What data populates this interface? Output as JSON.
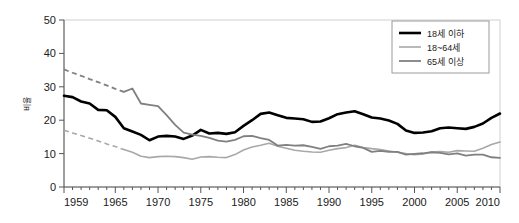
{
  "chart_data": {
    "type": "line",
    "title": "",
    "subtitle": "",
    "xlabel": "",
    "ylabel": "비율",
    "xlim": [
      1959,
      2010
    ],
    "ylim": [
      0,
      50
    ],
    "grid": false,
    "legend_position": "top-right",
    "x_tick_labels": [
      "1959",
      "1965",
      "1970",
      "1975",
      "1980",
      "1985",
      "1990",
      "1995",
      "2000",
      "2005",
      "2010"
    ],
    "x_tick_values": [
      1959,
      1965,
      1970,
      1975,
      1980,
      1985,
      1990,
      1995,
      2000,
      2005,
      2010
    ],
    "x_minor_tick_step": 1,
    "y_tick_labels": [
      "0",
      "10",
      "20",
      "30",
      "40",
      "50"
    ],
    "y_tick_values": [
      0,
      10,
      20,
      30,
      40,
      50
    ],
    "x": [
      1959,
      1960,
      1961,
      1962,
      1963,
      1964,
      1965,
      1966,
      1967,
      1968,
      1969,
      1970,
      1971,
      1972,
      1973,
      1974,
      1975,
      1976,
      1977,
      1978,
      1979,
      1980,
      1981,
      1982,
      1983,
      1984,
      1985,
      1986,
      1987,
      1988,
      1989,
      1990,
      1991,
      1992,
      1993,
      1994,
      1995,
      1996,
      1997,
      1998,
      1999,
      2000,
      2001,
      2002,
      2003,
      2004,
      2005,
      2006,
      2007,
      2008,
      2009,
      2010
    ],
    "series": [
      {
        "name": "18세 이하",
        "color": "#000000",
        "width": 2.6,
        "style": "solid",
        "dashed_until": 1959,
        "values": [
          27.3,
          26.9,
          25.6,
          25.0,
          23.1,
          23.0,
          21.0,
          17.6,
          16.6,
          15.6,
          14.0,
          15.1,
          15.3,
          15.1,
          14.4,
          15.4,
          17.1,
          16.0,
          16.2,
          15.9,
          16.4,
          18.3,
          20.0,
          21.9,
          22.3,
          21.5,
          20.7,
          20.5,
          20.3,
          19.5,
          19.6,
          20.6,
          21.8,
          22.3,
          22.7,
          21.8,
          20.8,
          20.5,
          19.9,
          18.9,
          16.9,
          16.2,
          16.3,
          16.7,
          17.6,
          17.8,
          17.6,
          17.4,
          18.0,
          19.0,
          20.7,
          22.0
        ]
      },
      {
        "name": "18~64세",
        "color": "#a8a8a8",
        "width": 1.6,
        "style": "dashed-then-solid",
        "dashed_until": 1966,
        "values": [
          17.0,
          16.2,
          15.4,
          14.6,
          13.8,
          12.9,
          12.1,
          11.2,
          10.4,
          9.2,
          8.8,
          9.1,
          9.2,
          9.1,
          8.8,
          8.3,
          9.0,
          9.1,
          8.9,
          8.8,
          9.7,
          11.1,
          12.0,
          12.5,
          13.1,
          12.2,
          11.6,
          11.0,
          10.7,
          10.5,
          10.4,
          11.0,
          11.5,
          11.8,
          12.5,
          11.8,
          11.5,
          11.2,
          10.8,
          10.4,
          10.0,
          9.7,
          9.9,
          10.5,
          10.6,
          10.4,
          10.9,
          10.8,
          10.7,
          11.6,
          12.7,
          13.5
        ]
      },
      {
        "name": "65세 이상",
        "color": "#808080",
        "width": 1.8,
        "style": "dashed-then-solid",
        "dashed_until": 1966,
        "values": [
          35.2,
          34.2,
          33.3,
          32.3,
          31.4,
          30.4,
          29.4,
          28.5,
          29.5,
          25.0,
          24.6,
          24.2,
          21.5,
          18.6,
          16.3,
          15.7,
          15.3,
          14.7,
          13.9,
          13.6,
          14.1,
          15.2,
          15.3,
          14.6,
          14.1,
          12.4,
          12.6,
          12.4,
          12.5,
          12.0,
          11.4,
          12.2,
          12.4,
          12.9,
          12.2,
          11.7,
          10.5,
          10.8,
          10.5,
          10.5,
          9.7,
          9.9,
          10.1,
          10.4,
          10.2,
          9.8,
          10.1,
          9.4,
          9.7,
          9.7,
          8.9,
          8.7
        ]
      }
    ],
    "legend_entries": [
      {
        "label": "18세 이하",
        "color": "#000000",
        "width": 2.6,
        "style": "solid"
      },
      {
        "label": "18~64세",
        "color": "#a8a8a8",
        "width": 1.6,
        "style": "solid"
      },
      {
        "label": "65세 이상",
        "color": "#808080",
        "width": 1.8,
        "style": "solid"
      }
    ],
    "colors": {
      "frame": "#d0d0d0",
      "axis": "#555555",
      "text": "#1a1a1a",
      "background": "#ffffff"
    }
  }
}
